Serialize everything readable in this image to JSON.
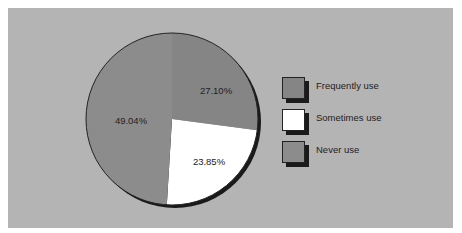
{
  "chart_data": {
    "type": "pie",
    "title": "",
    "categories": [
      "Frequently use",
      "Sometimes use",
      "Never use"
    ],
    "values": [
      27.1,
      23.85,
      49.04
    ],
    "value_labels": [
      "27.10%",
      "23.85%",
      "49.04%"
    ],
    "colors": [
      "#858585",
      "#ffffff",
      "#8c8c8c"
    ],
    "legend_position": "right",
    "style": "3d-shadow pie"
  },
  "legend": {
    "items": [
      {
        "label": "Frequently use",
        "color": "#858585"
      },
      {
        "label": "Sometimes use",
        "color": "#ffffff"
      },
      {
        "label": "Never use",
        "color": "#8c8c8c"
      }
    ]
  },
  "colors": {
    "panel": "#b4b4b4",
    "page": "#ffffff",
    "shadow": "#1a1a1a"
  }
}
